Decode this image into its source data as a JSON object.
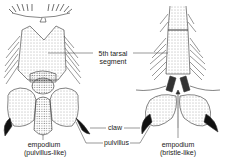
{
  "diagram": {
    "specimens": [
      {
        "id": "left",
        "caption_line1": "empodium",
        "caption_line2": "(pulvillus-like)"
      },
      {
        "id": "right",
        "caption_line1": "empodium",
        "caption_line2": "(bristle-like)"
      }
    ],
    "labels": {
      "tarsal_line1": "5th tarsal",
      "tarsal_line2": "segment",
      "claw": "claw",
      "pulvillus": "pulvillus"
    },
    "colors": {
      "ink": "#222222",
      "background": "#ffffff",
      "stipple": "#555555"
    }
  }
}
